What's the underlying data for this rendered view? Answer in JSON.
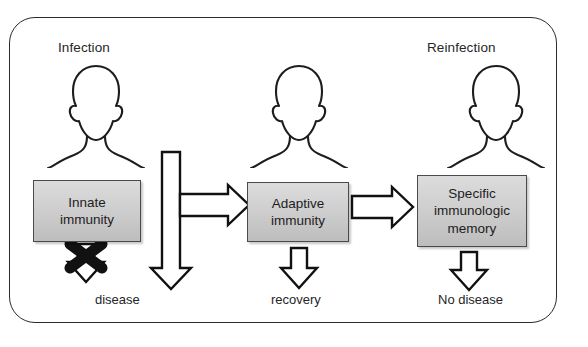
{
  "figure": {
    "type": "flow-diagram",
    "topic": "Immune response pathway: infection to reinfection",
    "cropped_caption_line": "",
    "background_color": "#ffffff",
    "frame": {
      "shape": "rounded-rectangle",
      "border_color": "#2b2b2b",
      "fill_color": "#ffffff"
    }
  },
  "headers": {
    "left": "Infection",
    "right": "Reinfection"
  },
  "people": [
    {
      "name": "person-silhouette-infection"
    },
    {
      "name": "person-silhouette-adaptive"
    },
    {
      "name": "person-silhouette-reinfection"
    }
  ],
  "boxes": [
    {
      "id": "innate",
      "label": "Innate\nimmunity",
      "line1": "Innate",
      "line2": "immunity",
      "fill_color": "#cfcfcf",
      "border_color": "#4a4a4a"
    },
    {
      "id": "adaptive",
      "label": "Adaptive\nimmunity",
      "line1": "Adaptive",
      "line2": "immunity",
      "fill_color": "#cfcfcf",
      "border_color": "#4a4a4a"
    },
    {
      "id": "memory",
      "label": "Specific\nimmunologic\nmemory",
      "line1": "Specific",
      "line2": "immunologic",
      "line3": "memory",
      "fill_color": "#cfcfcf",
      "border_color": "#4a4a4a"
    }
  ],
  "outcomes": {
    "disease": "disease",
    "recovery": "recovery",
    "no_disease": "No disease"
  },
  "arrows": [
    {
      "id": "big-down-arrow",
      "direction": "down",
      "style": "hollow-block",
      "from": "infection",
      "to": "disease-outcome"
    },
    {
      "id": "innate-to-adaptive-arrow",
      "direction": "right",
      "style": "hollow-block",
      "from": "innate",
      "to": "adaptive"
    },
    {
      "id": "adaptive-to-memory-arrow",
      "direction": "right",
      "style": "hollow-block",
      "from": "adaptive",
      "to": "memory"
    },
    {
      "id": "adaptive-down-arrow",
      "direction": "down",
      "style": "hollow-block",
      "from": "adaptive",
      "to": "recovery"
    },
    {
      "id": "memory-down-arrow",
      "direction": "down",
      "style": "hollow-block",
      "from": "memory",
      "to": "no-disease"
    },
    {
      "id": "blocked-down-arrow",
      "direction": "down",
      "style": "hollow-block-crossed-out",
      "from": "innate",
      "to": "disease",
      "blocked": true
    }
  ],
  "markers": {
    "blocked_x": {
      "name": "blocked-pathway-x-mark",
      "color": "#111111"
    }
  }
}
